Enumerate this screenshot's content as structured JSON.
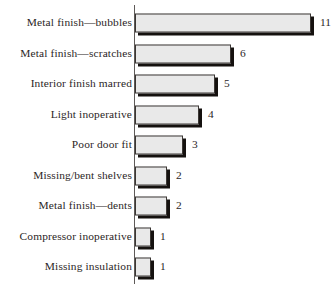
{
  "chart_data": {
    "type": "bar",
    "orientation": "horizontal",
    "title": "",
    "subtitle": "",
    "xlabel": "",
    "ylabel": "",
    "grid": false,
    "legend": false,
    "legend_position": "none",
    "axis_line": "vertical category axis at left of bars",
    "xlim": [
      0,
      12
    ],
    "categories": [
      "Metal finish—bubbles",
      "Metal finish—scratches",
      "Interior finish marred",
      "Light inoperative",
      "Poor door fit",
      "Missing/bent shelves",
      "Metal finish—dents",
      "Compressor inoperative",
      "Missing insulation"
    ],
    "values": [
      11,
      6,
      5,
      4,
      3,
      2,
      2,
      1,
      1
    ],
    "value_labels": [
      "11",
      "6",
      "5",
      "4",
      "3",
      "2",
      "2",
      "1",
      "1"
    ],
    "bars": [
      {
        "label": "Metal finish—bubbles",
        "value": 11,
        "value_label": "11"
      },
      {
        "label": "Metal finish—scratches",
        "value": 6,
        "value_label": "6"
      },
      {
        "label": "Interior finish marred",
        "value": 5,
        "value_label": "5"
      },
      {
        "label": "Light inoperative",
        "value": 4,
        "value_label": "4"
      },
      {
        "label": "Poor door fit",
        "value": 3,
        "value_label": "3"
      },
      {
        "label": "Missing/bent shelves",
        "value": 2,
        "value_label": "2"
      },
      {
        "label": "Metal finish—dents",
        "value": 2,
        "value_label": "2"
      },
      {
        "label": "Compressor inoperative",
        "value": 1,
        "value_label": "1"
      },
      {
        "label": "Missing insulation",
        "value": 1,
        "value_label": "1"
      }
    ],
    "colors": {
      "bar_fill": "#e9e9e9",
      "bar_border": "#3b3734",
      "bar_shadow": "#15110f",
      "axis": "#5e5a58",
      "text": "#2b2626",
      "background": "#ffffff"
    }
  },
  "layout": {
    "axis_x_px": 135,
    "px_per_unit": 16,
    "row_pitch_px": 30.5,
    "first_row_top_px": 8,
    "bar_height_px": 19
  }
}
